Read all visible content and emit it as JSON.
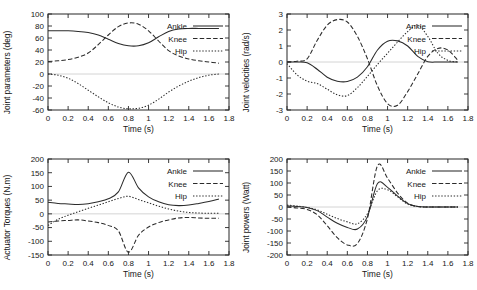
{
  "figure": {
    "title": "",
    "panel_count": 4,
    "background_color": "#ffffff",
    "line_color": "#2b2b2b",
    "zero_line_color": "#c9c9c9"
  },
  "chart_data": [
    {
      "id": "joint-parameters",
      "type": "line",
      "title": "",
      "xlabel": "Time (s)",
      "ylabel": "Joint parameters (deg)",
      "xlim": [
        0,
        1.8
      ],
      "ylim": [
        -60,
        100
      ],
      "xticks": [
        "0",
        "0.2",
        "0.4",
        "0.6",
        "0.8",
        "1",
        "1.2",
        "1.4",
        "1.6",
        "1.8"
      ],
      "xtick_values": [
        0,
        0.2,
        0.4,
        0.6,
        0.8,
        1.0,
        1.2,
        1.4,
        1.6,
        1.8
      ],
      "yticks": [
        "100",
        "80",
        "60",
        "40",
        "20",
        "0",
        "-20",
        "-40",
        "-60"
      ],
      "ytick_values": [
        100,
        80,
        60,
        40,
        20,
        0,
        -20,
        -40,
        -60
      ],
      "grid": false,
      "legend_position": "right-upper",
      "x": [
        0,
        0.1,
        0.2,
        0.3,
        0.4,
        0.5,
        0.6,
        0.7,
        0.8,
        0.9,
        1.0,
        1.1,
        1.2,
        1.3,
        1.4,
        1.5,
        1.6,
        1.7
      ],
      "series": [
        {
          "name": "Ankle",
          "style": "solid",
          "values": [
            72,
            72,
            72,
            71,
            69,
            65,
            58,
            51,
            47,
            47,
            52,
            62,
            71,
            75,
            76,
            76,
            76,
            76
          ]
        },
        {
          "name": "Knee",
          "style": "dashed",
          "values": [
            21,
            22,
            24,
            28,
            35,
            49,
            65,
            79,
            85,
            83,
            72,
            55,
            39,
            30,
            25,
            22,
            20,
            18
          ]
        },
        {
          "name": "Hip",
          "style": "dotted",
          "values": [
            0,
            -2,
            -7,
            -16,
            -27,
            -38,
            -48,
            -55,
            -58,
            -57,
            -52,
            -42,
            -30,
            -20,
            -12,
            -6,
            -2,
            0
          ]
        }
      ]
    },
    {
      "id": "joint-velocities",
      "type": "line",
      "title": "",
      "xlabel": "Time (s)",
      "ylabel": "Joint velocities (rad/s)",
      "xlim": [
        0,
        1.8
      ],
      "ylim": [
        -3,
        3
      ],
      "xticks": [
        "0",
        "0.2",
        "0.4",
        "0.6",
        "0.8",
        "1",
        "1.2",
        "1.4",
        "1.6",
        "1.8"
      ],
      "xtick_values": [
        0,
        0.2,
        0.4,
        0.6,
        0.8,
        1.0,
        1.2,
        1.4,
        1.6,
        1.8
      ],
      "yticks": [
        "3",
        "2",
        "1",
        "0",
        "-1",
        "-2",
        "-3"
      ],
      "ytick_values": [
        3,
        2,
        1,
        0,
        -1,
        -2,
        -3
      ],
      "grid": false,
      "legend_position": "right-upper",
      "x": [
        0,
        0.1,
        0.2,
        0.3,
        0.4,
        0.5,
        0.6,
        0.7,
        0.8,
        0.9,
        1.0,
        1.1,
        1.2,
        1.3,
        1.4,
        1.5,
        1.6,
        1.7
      ],
      "series": [
        {
          "name": "Ankle",
          "style": "solid",
          "values": [
            0,
            0,
            -0.05,
            -0.45,
            -0.95,
            -1.2,
            -1.22,
            -0.95,
            -0.3,
            0.75,
            1.3,
            1.32,
            1.0,
            0.35,
            0.02,
            0,
            0,
            0
          ]
        },
        {
          "name": "Knee",
          "style": "dashed",
          "values": [
            0,
            0.05,
            0.2,
            1.35,
            2.3,
            2.65,
            2.5,
            1.6,
            0.2,
            -1.5,
            -2.6,
            -2.7,
            -1.85,
            -0.75,
            0.35,
            0.85,
            0.75,
            0.1
          ]
        },
        {
          "name": "Hip",
          "style": "dotted",
          "values": [
            -0.1,
            -0.8,
            -1.2,
            -1.35,
            -1.7,
            -2.05,
            -2.1,
            -1.6,
            -0.9,
            -0.15,
            0.55,
            1.25,
            1.9,
            2.3,
            1.6,
            0.55,
            0.1,
            0
          ]
        }
      ]
    },
    {
      "id": "actuator-torques",
      "type": "line",
      "title": "",
      "xlabel": "Time (s)",
      "ylabel": "Actuator Torques (N.m)",
      "xlim": [
        0,
        1.8
      ],
      "ylim": [
        -150,
        200
      ],
      "xticks": [
        "0",
        "0.2",
        "0.4",
        "0.6",
        "0.8",
        "1",
        "1.2",
        "1.4",
        "1.6",
        "1.8"
      ],
      "xtick_values": [
        0,
        0.2,
        0.4,
        0.6,
        0.8,
        1.0,
        1.2,
        1.4,
        1.6,
        1.8
      ],
      "yticks": [
        "200",
        "150",
        "100",
        "50",
        "0",
        "-50",
        "-100",
        "-150"
      ],
      "ytick_values": [
        200,
        150,
        100,
        50,
        0,
        -50,
        -100,
        -150
      ],
      "grid": false,
      "legend_position": "right-upper",
      "x": [
        0,
        0.1,
        0.2,
        0.3,
        0.4,
        0.5,
        0.6,
        0.7,
        0.8,
        0.9,
        1.0,
        1.1,
        1.2,
        1.3,
        1.4,
        1.5,
        1.6,
        1.7
      ],
      "series": [
        {
          "name": "Ankle",
          "style": "solid",
          "values": [
            42,
            38,
            36,
            34,
            37,
            44,
            55,
            80,
            152,
            95,
            62,
            44,
            33,
            30,
            32,
            38,
            45,
            54
          ]
        },
        {
          "name": "Knee",
          "style": "dashed",
          "values": [
            -30,
            -26,
            -24,
            -22,
            -26,
            -32,
            -42,
            -62,
            -140,
            -78,
            -48,
            -32,
            -22,
            -15,
            -13,
            -15,
            -16,
            -16
          ]
        },
        {
          "name": "Hip",
          "style": "dotted",
          "values": [
            -42,
            -20,
            -5,
            8,
            20,
            32,
            44,
            56,
            64,
            52,
            40,
            28,
            18,
            10,
            5,
            3,
            2,
            2
          ]
        }
      ]
    },
    {
      "id": "joint-powers",
      "type": "line",
      "title": "",
      "xlabel": "Time (s)",
      "ylabel": "Joint powers (Watt)",
      "xlim": [
        0,
        1.8
      ],
      "ylim": [
        -200,
        200
      ],
      "xticks": [
        "0",
        "0.2",
        "0.4",
        "0.6",
        "0.8",
        "1",
        "1.2",
        "1.4",
        "1.6",
        "1.8"
      ],
      "xtick_values": [
        0,
        0.2,
        0.4,
        0.6,
        0.8,
        1.0,
        1.2,
        1.4,
        1.6,
        1.8
      ],
      "yticks": [
        "200",
        "150",
        "100",
        "50",
        "0",
        "-50",
        "-100",
        "-150",
        "-200"
      ],
      "ytick_values": [
        200,
        150,
        100,
        50,
        0,
        -50,
        -100,
        -150,
        -200
      ],
      "grid": false,
      "legend_position": "right-upper",
      "x": [
        0,
        0.1,
        0.2,
        0.3,
        0.4,
        0.5,
        0.6,
        0.7,
        0.8,
        0.9,
        1.0,
        1.1,
        1.2,
        1.3,
        1.4,
        1.5,
        1.6,
        1.7
      ],
      "series": [
        {
          "name": "Ankle",
          "style": "solid",
          "values": [
            5,
            2,
            -2,
            -15,
            -42,
            -68,
            -85,
            -92,
            -40,
            98,
            82,
            45,
            14,
            2,
            0,
            0,
            0,
            0
          ]
        },
        {
          "name": "Knee",
          "style": "dashed",
          "values": [
            0,
            -4,
            -10,
            -32,
            -78,
            -128,
            -158,
            -152,
            -48,
            172,
            120,
            58,
            16,
            2,
            0,
            0,
            0,
            0
          ]
        },
        {
          "name": "Hip",
          "style": "dotted",
          "values": [
            8,
            4,
            -2,
            -12,
            -30,
            -48,
            -62,
            -70,
            -28,
            68,
            72,
            42,
            12,
            2,
            0,
            0,
            0,
            0
          ]
        }
      ]
    }
  ],
  "legend": {
    "entries": [
      {
        "label": "Ankle",
        "style": "solid"
      },
      {
        "label": "Knee",
        "style": "dashed"
      },
      {
        "label": "Hip",
        "style": "dotted"
      }
    ]
  }
}
